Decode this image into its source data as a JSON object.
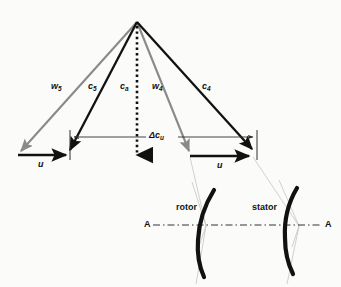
{
  "figure": {
    "type": "engineering-vector-diagram",
    "width": 341,
    "height": 287,
    "background_color": "#fbfbfa"
  },
  "colors": {
    "absolute_velocity": "#111111",
    "relative_velocity": "#8a8a8a",
    "axial_velocity": "#111111",
    "blade_profile": "#111111",
    "construction_line": "#b5b5b5",
    "dimension_line": "#4a4a4a",
    "axis_line": "#333333"
  },
  "labels": {
    "w5": {
      "base": "w",
      "sub": "5",
      "x": 51,
      "y": 82
    },
    "c5": {
      "base": "c",
      "sub": "5",
      "x": 88,
      "y": 82
    },
    "ca": {
      "base": "c",
      "sub": "a",
      "x": 121,
      "y": 82
    },
    "w4": {
      "base": "w",
      "sub": "4",
      "x": 152,
      "y": 82
    },
    "c4": {
      "base": "c",
      "sub": "4",
      "x": 202,
      "y": 82
    },
    "delta_cu": {
      "text": "Δc",
      "sub": "u",
      "x": 150,
      "y": 133
    },
    "u_left": {
      "base": "u",
      "x": 38,
      "y": 160
    },
    "u_right": {
      "base": "u",
      "x": 218,
      "y": 161
    },
    "rotor": {
      "text": "rotor",
      "x": 176,
      "y": 207
    },
    "stator": {
      "text": "stator",
      "x": 253,
      "y": 207
    },
    "axis_left": {
      "text": "A",
      "x": 146,
      "y": 222
    },
    "axis_right": {
      "text": "A",
      "x": 326,
      "y": 222
    }
  },
  "vectors": [
    {
      "name": "w5",
      "style": "relative",
      "color": "#8a8a8a",
      "from": [
        137,
        22
      ],
      "to": [
        18,
        154
      ],
      "arrowhead": true
    },
    {
      "name": "c5",
      "style": "absolute",
      "color": "#111111",
      "from": [
        137,
        22
      ],
      "to": [
        70,
        155
      ],
      "arrowhead": true
    },
    {
      "name": "ca",
      "style": "axial-dotted",
      "color": "#111111",
      "from": [
        137,
        24
      ],
      "to": [
        137,
        163
      ],
      "arrowhead": true
    },
    {
      "name": "w4",
      "style": "relative",
      "color": "#8a8a8a",
      "from": [
        137,
        22
      ],
      "to": [
        190,
        155
      ],
      "arrowhead": true
    },
    {
      "name": "c4",
      "style": "absolute",
      "color": "#111111",
      "from": [
        137,
        22
      ],
      "to": [
        253,
        154
      ],
      "arrowhead": true
    },
    {
      "name": "u-left",
      "style": "blade-speed",
      "color": "#111111",
      "from": [
        18,
        155
      ],
      "to": [
        70,
        155
      ],
      "arrowhead": true
    },
    {
      "name": "u-right",
      "style": "blade-speed",
      "color": "#111111",
      "from": [
        190,
        156
      ],
      "to": [
        253,
        156
      ],
      "arrowhead": true
    }
  ],
  "dimension": {
    "name": "delta-cu",
    "label": "Δc_u",
    "y": 137,
    "left_x": 70,
    "right_x": 257,
    "left_tick": {
      "x": 70,
      "y0": 130,
      "y1": 160
    },
    "right_tick": {
      "x": 257,
      "y0": 130,
      "y1": 160
    }
  },
  "blades": [
    {
      "name": "rotor-blade",
      "label": "rotor",
      "color": "#111111"
    },
    {
      "name": "stator-blade",
      "label": "stator",
      "color": "#111111"
    }
  ],
  "axis": {
    "name": "section-line-A-A",
    "left_label": "A",
    "right_label": "A",
    "y": 225,
    "x0": 152,
    "x1": 322,
    "style": "dash-dot"
  }
}
